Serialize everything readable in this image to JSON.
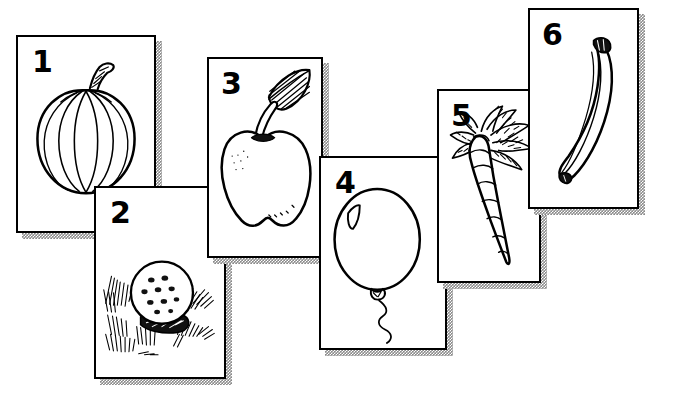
{
  "page": {
    "style": "black-and-white line art on white cards with speckled gray drop shadows",
    "background_color": "#ffffff",
    "ink_color": "#000000",
    "shadow_color": "#8a8a8a",
    "card_count": 6
  },
  "cards": [
    {
      "number": "1",
      "subject": "pumpkin",
      "icon": "pumpkin-icon",
      "x": 16,
      "y": 35,
      "w": 140,
      "h": 198,
      "shadow_x": 22,
      "shadow_y": 41,
      "shadow_w": 140,
      "shadow_h": 198,
      "num_x": 14,
      "num_y": 10
    },
    {
      "number": "2",
      "subject": "golf ball on grass",
      "icon": "golf-ball-icon",
      "x": 94,
      "y": 186,
      "w": 132,
      "h": 193,
      "shadow_x": 100,
      "shadow_y": 192,
      "shadow_w": 132,
      "shadow_h": 193,
      "num_x": 14,
      "num_y": 10
    },
    {
      "number": "3",
      "subject": "apple with leaf",
      "icon": "apple-icon",
      "x": 207,
      "y": 57,
      "w": 116,
      "h": 201,
      "shadow_x": 213,
      "shadow_y": 63,
      "shadow_w": 116,
      "shadow_h": 201,
      "num_x": 12,
      "num_y": 10
    },
    {
      "number": "4",
      "subject": "balloon with string",
      "icon": "balloon-icon",
      "x": 319,
      "y": 156,
      "w": 128,
      "h": 194,
      "shadow_x": 325,
      "shadow_y": 162,
      "shadow_w": 128,
      "shadow_h": 194,
      "num_x": 14,
      "num_y": 10
    },
    {
      "number": "5",
      "subject": "carrot",
      "icon": "carrot-icon",
      "x": 437,
      "y": 89,
      "w": 104,
      "h": 194,
      "shadow_x": 443,
      "shadow_y": 95,
      "shadow_w": 104,
      "shadow_h": 194,
      "num_x": 12,
      "num_y": 10
    },
    {
      "number": "6",
      "subject": "banana",
      "icon": "banana-icon",
      "x": 528,
      "y": 8,
      "w": 111,
      "h": 201,
      "shadow_x": 534,
      "shadow_y": 14,
      "shadow_w": 111,
      "shadow_h": 201,
      "num_x": 12,
      "num_y": 10
    }
  ]
}
